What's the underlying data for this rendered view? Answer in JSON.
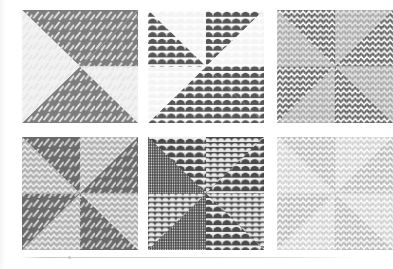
{
  "figure": {
    "layout": {
      "rows": 2,
      "cols": 3,
      "panel_count": 6
    },
    "background_color": "#ffffff",
    "divider_color": "#c6c8cb"
  },
  "palette": {
    "paper_white": "#ffffff",
    "near_white": "#f2f2f2",
    "light_gray": "#d9d9d9",
    "mid_gray": "#b3b3b3",
    "gray": "#999999",
    "dark_gray": "#6e6e6e",
    "charcoal": "#595959",
    "ink": "#4d4d4d"
  },
  "textures": {
    "dash": {
      "name": "diagonal-dash-texture",
      "label": "diagonal dashes"
    },
    "scale": {
      "name": "fish-scale-texture",
      "label": "fish scale scallops"
    },
    "zigzag": {
      "name": "zigzag-texture",
      "label": "zigzag chevrons"
    }
  },
  "panels": [
    {
      "id": "panel-1",
      "name": "pinwheel-dash-light",
      "texture": "dash",
      "background": "#f2f2f2",
      "wedge_colors": [
        "#f2f2f2",
        "#7d7d7d",
        "#7d7d7d",
        "#f2f2f2",
        "#f2f2f2",
        "#7d7d7d",
        "#7d7d7d",
        "#f2f2f2"
      ],
      "motif_color": "#e8e8e8",
      "motif_on_light": "#dcdcdc"
    },
    {
      "id": "panel-2",
      "name": "pinwheel-scale-light",
      "texture": "scale",
      "background": "#fbfbfb",
      "wedge_colors": [
        "#fbfbfb",
        "#5c5c5c",
        "#5c5c5c",
        "#fbfbfb",
        "#fbfbfb",
        "#5c5c5c",
        "#5c5c5c",
        "#fbfbfb"
      ],
      "motif_color": "#ffffff",
      "motif_on_light": "#efefef"
    },
    {
      "id": "panel-3",
      "name": "pinwheel-zigzag-mid",
      "texture": "zigzag",
      "background": "#a8a8a8",
      "wedge_colors": [
        "#a8a8a8",
        "#5f5f5f",
        "#5f5f5f",
        "#a8a8a8",
        "#a8a8a8",
        "#5f5f5f",
        "#5f5f5f",
        "#a8a8a8"
      ],
      "motif_color": "#ffffff",
      "motif_on_light": "#e2e2e2"
    },
    {
      "id": "panel-4",
      "name": "pinwheel-dash-zigzag-mixed",
      "texture": "mixed",
      "background": "#b0b0b0",
      "wedge_colors": [
        "#b0b0b0",
        "#6a6a6a",
        "#6a6a6a",
        "#b0b0b0",
        "#b0b0b0",
        "#6a6a6a",
        "#6a6a6a",
        "#b0b0b0"
      ],
      "motif_color": "#ffffff",
      "motif_on_light": "#e0e0e0"
    },
    {
      "id": "panel-5",
      "name": "pinwheel-scale-dark",
      "texture": "scale",
      "background": "#4f4f4f",
      "wedge_colors": [
        "#4f4f4f",
        "#565656",
        "#565656",
        "#4f4f4f",
        "#4f4f4f",
        "#565656",
        "#565656",
        "#4f4f4f"
      ],
      "motif_color": "#fdfdfd",
      "motif_on_light": "#f5f5f5"
    },
    {
      "id": "panel-6",
      "name": "pinwheel-zigzag-pale",
      "texture": "zigzag",
      "background": "#cfcfcf",
      "wedge_colors": [
        "#cfcfcf",
        "#b5b5b5",
        "#b5b5b5",
        "#cfcfcf",
        "#cfcfcf",
        "#b5b5b5",
        "#b5b5b5",
        "#cfcfcf"
      ],
      "motif_color": "#ffffff",
      "motif_on_light": "#ececec"
    }
  ]
}
